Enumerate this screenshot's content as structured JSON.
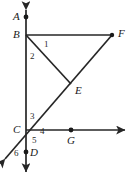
{
  "figure": {
    "type": "geometry-diagram",
    "background_color": "#ffffff",
    "stroke_color": "#262626",
    "points": {
      "A": {
        "label": "A",
        "x": 26,
        "y": 17,
        "dot": true
      },
      "B": {
        "label": "B",
        "x": 26,
        "y": 35,
        "dot": false
      },
      "C": {
        "label": "C",
        "x": 26,
        "y": 130,
        "dot": false
      },
      "D": {
        "label": "D",
        "x": 26,
        "y": 152,
        "dot": true
      },
      "E": {
        "label": "E",
        "x": 71,
        "y": 84,
        "dot": false
      },
      "F": {
        "label": "F",
        "x": 112,
        "y": 35,
        "dot": true
      },
      "G": {
        "label": "G",
        "x": 71,
        "y": 130,
        "dot": true
      }
    },
    "angle_labels": [
      {
        "name": "1",
        "text": "1",
        "x": 44,
        "y": 44
      },
      {
        "name": "2",
        "text": "2",
        "x": 31,
        "y": 56
      },
      {
        "name": "3",
        "text": "3",
        "x": 31,
        "y": 115
      },
      {
        "name": "4",
        "text": "4",
        "x": 41,
        "y": 130
      },
      {
        "name": "5",
        "text": "5",
        "x": 33,
        "y": 141
      },
      {
        "name": "6",
        "text": "6",
        "x": 16,
        "y": 152
      }
    ],
    "lines": {
      "vertical_AD": {
        "from": "above A",
        "to": "below D",
        "arrows": "both"
      },
      "horizontal_BF": {
        "from": "B",
        "to": "F",
        "arrows": "none"
      },
      "horizontal_C_right": {
        "from": "C",
        "through": "G",
        "arrows": "end"
      },
      "diagonal_through_C_E_F": {
        "from": "lower-left",
        "through": "C, E",
        "to": "F",
        "arrows": "start"
      },
      "segment_BE": {
        "from": "B",
        "to": "E",
        "arrows": "none"
      }
    }
  }
}
